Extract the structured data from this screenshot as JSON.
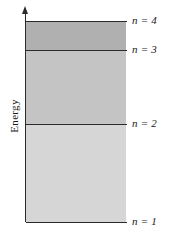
{
  "figure": {
    "axis": {
      "label": "Energy",
      "arrow_icon": "up-arrow-icon"
    },
    "levels": [
      {
        "label": "n = 4",
        "n": 4
      },
      {
        "label": "n = 3",
        "n": 3
      },
      {
        "label": "n = 2",
        "n": 2
      },
      {
        "label": "n = 1",
        "n": 1
      }
    ],
    "bands": [
      {
        "name": "n3-to-n4",
        "color": "#b0b0b0"
      },
      {
        "name": "n2-to-n3",
        "color": "#c4c4c4"
      },
      {
        "name": "n1-to-n2",
        "color": "#d6d6d6"
      }
    ],
    "line_color": "#2b2b2b",
    "background": "#ffffff"
  }
}
